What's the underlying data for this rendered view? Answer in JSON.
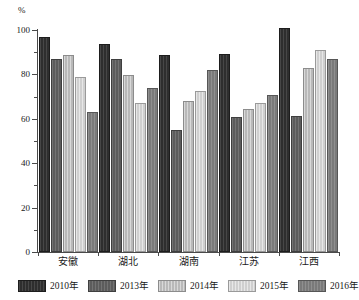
{
  "chart_data": {
    "type": "bar",
    "title": "",
    "xlabel": "",
    "ylabel": "%",
    "unit_label": "%",
    "ylim": [
      0,
      100
    ],
    "yticks": [
      0,
      20,
      40,
      60,
      80,
      100
    ],
    "ytick_labels": [
      "0",
      "20",
      "40",
      "60",
      "80",
      "100"
    ],
    "grid": false,
    "legend_position": "bottom",
    "categories": [
      "安徽",
      "湖北",
      "湖南",
      "江苏",
      "江西"
    ],
    "series": [
      {
        "name": "2010年",
        "color": "#2e2e2e",
        "values": [
          96,
          93,
          88,
          88.5,
          100
        ]
      },
      {
        "name": "2013年",
        "color": "#5c5c5c",
        "values": [
          86,
          86,
          54,
          60,
          60.5
        ]
      },
      {
        "name": "2014年",
        "color": "#b9b9b9",
        "values": [
          88,
          79,
          67,
          63.5,
          82
        ]
      },
      {
        "name": "2015年",
        "color": "#cfcfcf",
        "values": [
          78,
          66,
          71.5,
          66,
          90
        ]
      },
      {
        "name": "2016年",
        "color": "#7a7a7a",
        "values": [
          62,
          73,
          81,
          70,
          86
        ]
      }
    ]
  }
}
